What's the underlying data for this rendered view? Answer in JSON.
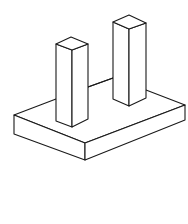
{
  "figure": {
    "stroke_color": "#1a1a1a",
    "background": "#ffffff",
    "objects": [
      {
        "name": "base-slab",
        "label": ""
      },
      {
        "name": "left-pillar",
        "label": ""
      },
      {
        "name": "right-pillar",
        "label": ""
      }
    ]
  }
}
